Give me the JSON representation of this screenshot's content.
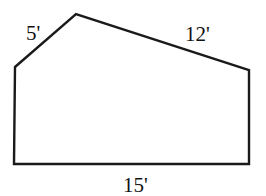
{
  "diagram": {
    "type": "pentagon-floor-plan",
    "stroke_color": "#1a1a1a",
    "vertices": [
      {
        "x": 15,
        "y": 67
      },
      {
        "x": 76,
        "y": 14
      },
      {
        "x": 249,
        "y": 70
      },
      {
        "x": 249,
        "y": 164
      },
      {
        "x": 14,
        "y": 164
      }
    ],
    "labels": {
      "diagonal_left": "5'",
      "top_slope": "12'",
      "bottom": "15'"
    }
  }
}
